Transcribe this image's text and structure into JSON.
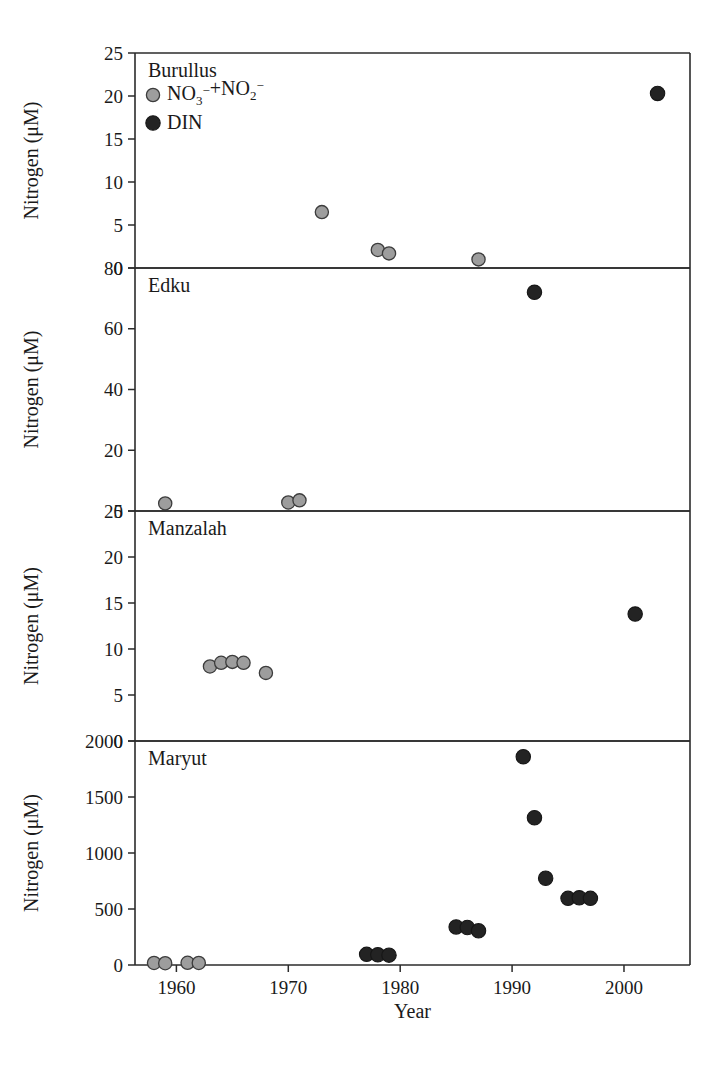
{
  "figure": {
    "xlabel": "Year",
    "ylabel": "Nitrogen (μM)",
    "legend": {
      "series1_label": "NO3-+NO2-",
      "series1_base1": "NO",
      "series1_sub1": "3",
      "series1_sup1": "−",
      "series1_plus": "+NO",
      "series1_sub2": "2",
      "series1_sup2": "−",
      "series2_label": "DIN",
      "series1_color": "#9d9d9d",
      "series2_color": "#232323"
    },
    "xticks": [
      "1960",
      "1970",
      "1980",
      "1990",
      "2000"
    ],
    "panels": [
      {
        "title": "Burullus",
        "yticks": [
          "0",
          "5",
          "10",
          "15",
          "20",
          "25"
        ]
      },
      {
        "title": "Edku",
        "yticks": [
          "0",
          "20",
          "40",
          "60",
          "80"
        ]
      },
      {
        "title": "Manzalah",
        "yticks": [
          "0",
          "5",
          "10",
          "15",
          "20",
          "25"
        ]
      },
      {
        "title": "Maryut",
        "yticks": [
          "0",
          "500",
          "1000",
          "1500",
          "2000"
        ]
      }
    ]
  },
  "chart_data": {
    "type": "scatter",
    "xlabel": "Year",
    "ylabel": "Nitrogen (μM)",
    "xlim": [
      1956,
      2005
    ],
    "xticks": [
      1960,
      1970,
      1980,
      1990,
      2000
    ],
    "grid": false,
    "legend_position": "top-left of first panel",
    "legend": [
      "NO3-+NO2-",
      "DIN"
    ],
    "panels": [
      {
        "name": "Burullus",
        "ylim": [
          0,
          25
        ],
        "yticks": [
          0,
          5,
          10,
          15,
          20,
          25
        ],
        "series": [
          {
            "name": "NO3-+NO2-",
            "marker": "gray-filled-circle",
            "points": [
              {
                "x": 1973,
                "y": 6.5
              },
              {
                "x": 1978,
                "y": 2.1
              },
              {
                "x": 1979,
                "y": 1.7
              },
              {
                "x": 1987,
                "y": 1.0
              }
            ]
          },
          {
            "name": "DIN",
            "marker": "black-filled-circle",
            "points": [
              {
                "x": 2003,
                "y": 20.3
              }
            ]
          }
        ]
      },
      {
        "name": "Edku",
        "ylim": [
          0,
          80
        ],
        "yticks": [
          0,
          20,
          40,
          60,
          80
        ],
        "series": [
          {
            "name": "NO3-+NO2-",
            "marker": "gray-filled-circle",
            "points": [
              {
                "x": 1959,
                "y": 2.5
              },
              {
                "x": 1970,
                "y": 2.8
              },
              {
                "x": 1971,
                "y": 3.5
              }
            ]
          },
          {
            "name": "DIN",
            "marker": "black-filled-circle",
            "points": [
              {
                "x": 1992,
                "y": 72.0
              }
            ]
          }
        ]
      },
      {
        "name": "Manzalah",
        "ylim": [
          0,
          25
        ],
        "yticks": [
          0,
          5,
          10,
          15,
          20,
          25
        ],
        "series": [
          {
            "name": "NO3-+NO2-",
            "marker": "gray-filled-circle",
            "points": [
              {
                "x": 1963,
                "y": 8.1
              },
              {
                "x": 1964,
                "y": 8.5
              },
              {
                "x": 1965,
                "y": 8.6
              },
              {
                "x": 1966,
                "y": 8.5
              },
              {
                "x": 1968,
                "y": 7.4
              }
            ]
          },
          {
            "name": "DIN",
            "marker": "black-filled-circle",
            "points": [
              {
                "x": 2001,
                "y": 13.8
              }
            ]
          }
        ]
      },
      {
        "name": "Maryut",
        "ylim": [
          0,
          2000
        ],
        "yticks": [
          0,
          500,
          1000,
          1500,
          2000
        ],
        "series": [
          {
            "name": "NO3-+NO2-",
            "marker": "gray-filled-circle",
            "points": [
              {
                "x": 1958,
                "y": 18
              },
              {
                "x": 1959,
                "y": 16
              },
              {
                "x": 1961,
                "y": 20
              },
              {
                "x": 1962,
                "y": 18
              }
            ]
          },
          {
            "name": "DIN",
            "marker": "black-filled-circle",
            "points": [
              {
                "x": 1977,
                "y": 95
              },
              {
                "x": 1978,
                "y": 92
              },
              {
                "x": 1979,
                "y": 88
              },
              {
                "x": 1985,
                "y": 340
              },
              {
                "x": 1986,
                "y": 335
              },
              {
                "x": 1987,
                "y": 305
              },
              {
                "x": 1991,
                "y": 1860
              },
              {
                "x": 1992,
                "y": 1315
              },
              {
                "x": 1993,
                "y": 775
              },
              {
                "x": 1995,
                "y": 595
              },
              {
                "x": 1996,
                "y": 600
              },
              {
                "x": 1997,
                "y": 595
              }
            ]
          }
        ]
      }
    ]
  }
}
